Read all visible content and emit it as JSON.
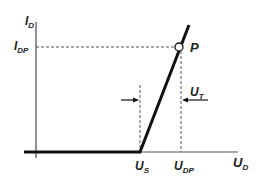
{
  "diagram": {
    "type": "MOSFET/diode I-V characteristic",
    "axes": {
      "y_label": "I",
      "y_label_sub": "D",
      "x_label": "U",
      "x_label_sub": "D"
    },
    "levels": {
      "current_label": "I",
      "current_label_sub": "DP"
    },
    "x_ticks": [
      {
        "label": "U",
        "sub": "S"
      },
      {
        "label": "U",
        "sub": "DP"
      }
    ],
    "point": {
      "label": "P"
    },
    "annotation": {
      "label": "U",
      "sub": "T"
    },
    "colors": {
      "curve": "#111111",
      "axis": "#555555",
      "dashed": "#555555",
      "text": "#222222"
    }
  }
}
